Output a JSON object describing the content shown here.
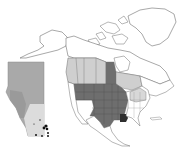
{
  "figure": {
    "type": "species-distribution-map",
    "region": "North America",
    "inset_region": "Alberta"
  },
  "legend_colors": {
    "background": "#ffffff",
    "outline": "#6f6f6f",
    "present_us_states": "#6e6e6e",
    "present_canadian_provinces": "#cfcfcf",
    "present_eastern_states": "#d8d8d8",
    "louisiana_highlight": "#2e2e2e",
    "inset_fill": "#a9a9a9",
    "inset_south_fill": "#dcdcdc",
    "locality_points": "#111111"
  },
  "shaded_regions": {
    "dark": [
      "Montana",
      "Wyoming",
      "Idaho",
      "Washington",
      "Oregon",
      "North Dakota",
      "South Dakota",
      "Nebraska",
      "Kansas",
      "Oklahoma",
      "Texas",
      "Minnesota",
      "Iowa",
      "Missouri",
      "Colorado",
      "New Mexico",
      "Arkansas",
      "Wisconsin",
      "Illinois"
    ],
    "darkest": [
      "Louisiana"
    ],
    "light": [
      "British Columbia",
      "Alberta",
      "Saskatchewan",
      "Manitoba",
      "Ontario",
      "New York",
      "Pennsylvania",
      "Ohio"
    ]
  },
  "inset": {
    "locality_point_count": 9
  }
}
